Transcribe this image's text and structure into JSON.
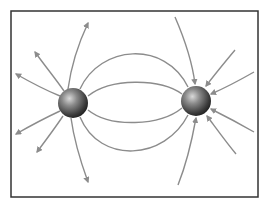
{
  "diagram": {
    "frame": {
      "x": 11,
      "y": 11,
      "width": 247,
      "height": 186,
      "stroke": "#333333"
    },
    "line_color": "#8c8c8c",
    "charges": [
      {
        "id": "source-charge",
        "label": "positive charge (field lines outward)",
        "cx": 73,
        "cy": 103,
        "r": 15
      },
      {
        "id": "sink-charge",
        "label": "negative charge (field lines inward)",
        "cx": 196,
        "cy": 101,
        "r": 15
      }
    ],
    "connecting_lines": [
      "M 88 96 C 110 78, 160 78, 182 94",
      "M 88 110 C 110 128, 160 126, 182 108",
      "M 80 89 C 100 45, 165 40, 188 87",
      "M 80 117 C 100 165, 165 160, 188 115"
    ],
    "outgoing_arrows": [
      {
        "path": "M 68 89 C 72 60, 80 40, 88 23",
        "tip": [
          88,
          23
        ]
      },
      {
        "path": "M 64 91 C 55 78, 45 66, 35 52",
        "tip": [
          35,
          52
        ]
      },
      {
        "path": "M 60 96 C 45 90, 30 82, 16 74",
        "tip": [
          16,
          74
        ]
      },
      {
        "path": "M 60 111 C 45 118, 30 126, 16 134",
        "tip": [
          16,
          134
        ]
      },
      {
        "path": "M 63 116 C 55 128, 46 140, 37 152",
        "tip": [
          37,
          152
        ]
      },
      {
        "path": "M 71 118 C 74 140, 80 160, 88 182",
        "tip": [
          88,
          182
        ]
      }
    ],
    "incoming_arrows": [
      {
        "path": "M 175 17 C 185 40, 192 60, 195 84",
        "tip": [
          195,
          84
        ]
      },
      {
        "path": "M 235 50 C 225 62, 215 74, 206 86",
        "tip": [
          206,
          86
        ]
      },
      {
        "path": "M 254 72 C 240 80, 225 88, 211 94",
        "tip": [
          211,
          94
        ]
      },
      {
        "path": "M 254 132 C 240 124, 225 116, 211 109",
        "tip": [
          211,
          109
        ]
      },
      {
        "path": "M 236 154 C 226 142, 216 128, 207 116",
        "tip": [
          207,
          116
        ]
      },
      {
        "path": "M 178 185 C 186 165, 192 140, 196 118",
        "tip": [
          196,
          118
        ]
      }
    ]
  }
}
